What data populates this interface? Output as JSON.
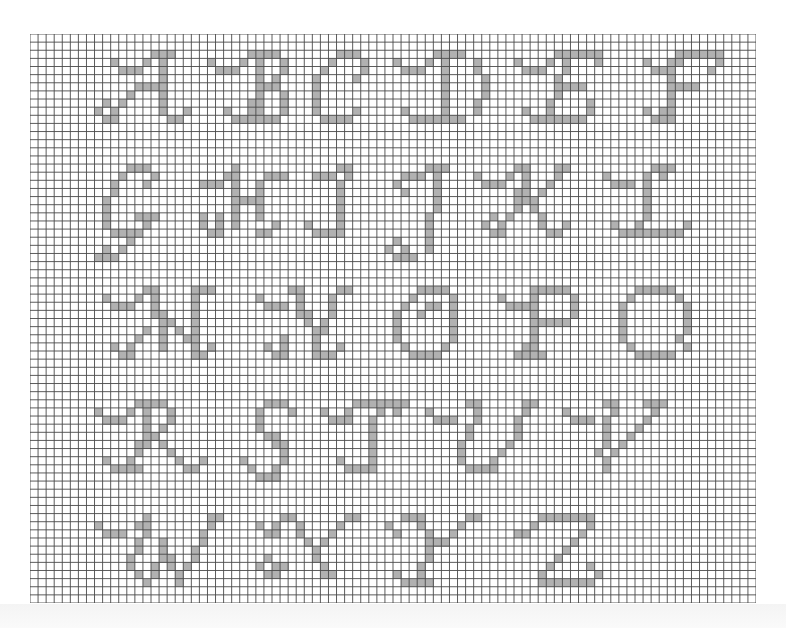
{
  "chart": {
    "cols": 90,
    "rows": 70,
    "origin_x": 30,
    "origin_y": 34,
    "width": 726,
    "height": 569,
    "grid_color": "#4a4a4a",
    "fill_color": "#b1b1b1",
    "background": "#ffffff"
  },
  "letters": [
    {
      "char": "A",
      "cells": {
        "2": [
          15,
          16,
          17
        ],
        "3": [
          10,
          14,
          16
        ],
        "4": [
          11,
          12,
          13,
          16
        ],
        "5": [
          16
        ],
        "6": [
          13,
          14,
          15,
          16
        ],
        "7": [
          12,
          16
        ],
        "8": [
          9,
          11,
          16
        ],
        "9": [
          8,
          10,
          16,
          19
        ],
        "10": [
          9,
          10,
          17,
          18
        ]
      }
    },
    {
      "char": "B",
      "cells": {
        "2": [
          27,
          28,
          29,
          30
        ],
        "3": [
          22,
          26,
          28,
          31
        ],
        "4": [
          23,
          24,
          25,
          28,
          31
        ],
        "5": [
          28,
          30
        ],
        "6": [
          28,
          29,
          30
        ],
        "7": [
          28,
          31
        ],
        "8": [
          27,
          28,
          31
        ],
        "9": [
          24,
          27,
          28,
          31
        ],
        "10": [
          25,
          26,
          27,
          28,
          29,
          30
        ]
      }
    },
    {
      "char": "C",
      "cells": {
        "2": [
          38,
          39,
          40
        ],
        "3": [
          37,
          41
        ],
        "4": [
          36,
          41
        ],
        "5": [
          35,
          40
        ],
        "6": [
          35
        ],
        "7": [
          35
        ],
        "8": [
          35
        ],
        "9": [
          35,
          40
        ],
        "10": [
          36,
          37,
          38,
          39
        ]
      }
    },
    {
      "char": "D",
      "cells": {
        "2": [
          50,
          51,
          52,
          53
        ],
        "3": [
          45,
          49,
          51,
          55
        ],
        "4": [
          46,
          47,
          48,
          51,
          55
        ],
        "5": [
          51,
          56
        ],
        "6": [
          51,
          56
        ],
        "7": [
          51,
          56
        ],
        "8": [
          51,
          55
        ],
        "9": [
          46,
          51,
          55
        ],
        "10": [
          47,
          48,
          49,
          50,
          51,
          52,
          53
        ]
      }
    },
    {
      "char": "E",
      "cells": {
        "2": [
          65,
          66,
          67,
          68,
          69,
          70
        ],
        "3": [
          60,
          64,
          66,
          70
        ],
        "4": [
          61,
          62,
          63,
          66
        ],
        "5": [
          65
        ],
        "6": [
          65,
          66,
          67,
          68
        ],
        "7": [
          65
        ],
        "8": [
          64,
          69
        ],
        "9": [
          61,
          64,
          69
        ],
        "10": [
          62,
          63,
          64,
          65,
          66,
          67,
          68
        ]
      }
    },
    {
      "char": "F",
      "cells": {
        "2": [
          80,
          81,
          82,
          83,
          84,
          85
        ],
        "3": [
          76,
          79,
          80,
          85
        ],
        "4": [
          77,
          78,
          79,
          84
        ],
        "5": [
          79
        ],
        "6": [
          79,
          80,
          81,
          82
        ],
        "7": [
          79
        ],
        "8": [
          79
        ],
        "9": [
          76,
          78,
          79
        ],
        "10": [
          77,
          78,
          79
        ]
      }
    },
    {
      "char": "G",
      "cells": {
        "16": [
          12,
          13,
          14
        ],
        "17": [
          11,
          15
        ],
        "18": [
          10,
          14
        ],
        "19": [
          10
        ],
        "20": [
          9
        ],
        "21": [
          9
        ],
        "22": [
          9,
          13,
          14,
          15
        ],
        "23": [
          9,
          14
        ],
        "24": [
          10,
          11,
          12,
          13
        ],
        "25": [
          12
        ],
        "26": [
          9,
          11
        ],
        "27": [
          8,
          9,
          10
        ]
      }
    },
    {
      "char": "H",
      "cells": {
        "16": [
          25
        ],
        "17": [
          24,
          25,
          29,
          30,
          31
        ],
        "18": [
          21,
          22,
          23,
          25,
          28
        ],
        "19": [
          25,
          28
        ],
        "20": [
          25,
          26,
          27,
          28
        ],
        "21": [
          25,
          28
        ],
        "22": [
          21,
          23,
          25,
          28
        ],
        "23": [
          21,
          23,
          25,
          30
        ],
        "24": [
          22,
          23,
          28,
          29
        ]
      }
    },
    {
      "char": "I",
      "cells": {
        "16": [
          38,
          39
        ],
        "17": [
          35,
          36,
          37,
          39
        ],
        "18": [
          38
        ],
        "19": [
          38
        ],
        "20": [
          38
        ],
        "21": [
          38
        ],
        "22": [
          38
        ],
        "23": [
          34,
          38
        ],
        "24": [
          35,
          36,
          37,
          38
        ]
      }
    },
    {
      "char": "J",
      "cells": {
        "16": [
          49,
          50,
          51
        ],
        "17": [
          46,
          47,
          48,
          50
        ],
        "18": [
          45,
          50
        ],
        "19": [
          46,
          50
        ],
        "20": [
          50
        ],
        "21": [
          50
        ],
        "22": [
          49
        ],
        "23": [
          49
        ],
        "24": [
          49
        ],
        "25": [
          45,
          49
        ],
        "26": [
          44,
          46,
          49
        ],
        "27": [
          45,
          46,
          47
        ]
      }
    },
    {
      "char": "K",
      "cells": {
        "16": [
          60,
          61,
          65,
          66
        ],
        "17": [
          55,
          59,
          61,
          65
        ],
        "18": [
          56,
          57,
          58,
          61,
          64
        ],
        "19": [
          60,
          61,
          63
        ],
        "20": [
          60,
          61,
          62
        ],
        "21": [
          60,
          62
        ],
        "22": [
          57,
          59,
          63
        ],
        "23": [
          56,
          58,
          63,
          66
        ],
        "24": [
          57,
          58,
          64,
          65
        ]
      }
    },
    {
      "char": "L",
      "cells": {
        "16": [
          77,
          78,
          79
        ],
        "17": [
          71,
          76,
          78
        ],
        "18": [
          72,
          73,
          74,
          76
        ],
        "19": [
          76
        ],
        "20": [
          76
        ],
        "21": [
          76
        ],
        "22": [
          76
        ],
        "23": [
          72,
          75,
          81
        ],
        "24": [
          73,
          74,
          75,
          76,
          77,
          78,
          79,
          80
        ]
      }
    },
    {
      "char": "M",
      "cells": {
        "31": [
          14,
          15,
          20,
          21,
          22
        ],
        "32": [
          9,
          13,
          15,
          20
        ],
        "33": [
          10,
          11,
          12,
          15,
          20
        ],
        "34": [
          15,
          16,
          20
        ],
        "35": [
          16,
          17,
          20
        ],
        "36": [
          14,
          16,
          18,
          20
        ],
        "37": [
          13,
          16,
          19,
          20
        ],
        "38": [
          10,
          12,
          16,
          20,
          22
        ],
        "39": [
          11,
          12,
          20,
          21
        ]
      }
    },
    {
      "char": "N",
      "cells": {
        "31": [
          32,
          33,
          38,
          39
        ],
        "32": [
          28,
          33,
          37
        ],
        "33": [
          29,
          30,
          31,
          33,
          37
        ],
        "34": [
          33,
          34,
          37
        ],
        "35": [
          34,
          36
        ],
        "36": [
          35,
          36
        ],
        "37": [
          31,
          35
        ],
        "38": [
          29,
          31,
          35,
          38
        ],
        "39": [
          30,
          31,
          35,
          36,
          37
        ]
      }
    },
    {
      "char": "O",
      "cells": {
        "31": [
          48,
          49,
          50,
          51
        ],
        "32": [
          47,
          52
        ],
        "33": [
          46,
          49,
          50,
          52
        ],
        "34": [
          45,
          48,
          52
        ],
        "35": [
          45,
          52
        ],
        "36": [
          45,
          52
        ],
        "37": [
          45,
          52
        ],
        "38": [
          46,
          51
        ],
        "39": [
          47,
          48,
          49,
          50
        ]
      }
    },
    {
      "char": "P",
      "cells": {
        "31": [
          62,
          63,
          64,
          65,
          66
        ],
        "32": [
          58,
          62,
          67
        ],
        "33": [
          59,
          60,
          61,
          62,
          67
        ],
        "34": [
          62,
          67
        ],
        "35": [
          62,
          63,
          64,
          65,
          66
        ],
        "36": [
          62
        ],
        "37": [
          62
        ],
        "38": [
          61,
          62
        ],
        "39": [
          60,
          61,
          62,
          63
        ]
      }
    },
    {
      "char": "Q",
      "cells": {
        "31": [
          75,
          76,
          77,
          78,
          79
        ],
        "32": [
          74,
          80
        ],
        "33": [
          73,
          81
        ],
        "34": [
          73,
          81
        ],
        "35": [
          73,
          81
        ],
        "36": [
          73,
          81
        ],
        "37": [
          73,
          80
        ],
        "38": [
          74,
          81
        ],
        "39": [
          75,
          76,
          77,
          78,
          79
        ]
      }
    },
    {
      "char": "R",
      "cells": {
        "45": [
          13,
          14,
          15,
          16
        ],
        "46": [
          8,
          12,
          14,
          17
        ],
        "47": [
          9,
          10,
          11,
          14,
          17
        ],
        "48": [
          14,
          16
        ],
        "49": [
          14,
          15
        ],
        "50": [
          13,
          14,
          16
        ],
        "51": [
          13,
          17
        ],
        "52": [
          9,
          12,
          18,
          21
        ],
        "53": [
          10,
          11,
          12,
          13,
          19,
          20
        ]
      }
    },
    {
      "char": "S",
      "cells": {
        "45": [
          29,
          30,
          31
        ],
        "46": [
          28,
          32
        ],
        "47": [
          28
        ],
        "48": [
          28
        ],
        "49": [
          29,
          30
        ],
        "50": [
          30,
          31
        ],
        "51": [
          31
        ],
        "52": [
          26,
          31
        ],
        "53": [
          27,
          30
        ],
        "54": [
          28,
          29,
          30
        ]
      }
    },
    {
      "char": "T",
      "cells": {
        "45": [
          40,
          41,
          42,
          43,
          44
        ],
        "46": [
          36,
          39,
          43
        ],
        "47": [
          37,
          38,
          39,
          42
        ],
        "48": [
          42
        ],
        "49": [
          42
        ],
        "50": [
          42
        ],
        "51": [
          42
        ],
        "52": [
          38,
          42
        ],
        "53": [
          39,
          40,
          41,
          42
        ]
      }
    },
    {
      "char": "U",
      "cells": {
        "45": [
          45,
          46,
          54,
          55,
          61,
          62
        ],
        "46": [
          45,
          49,
          55,
          61
        ],
        "47": [
          50,
          51,
          52,
          55,
          60
        ],
        "48": [
          54,
          60
        ],
        "49": [
          54,
          60
        ],
        "50": [
          53,
          59
        ],
        "51": [
          53,
          58
        ],
        "52": [
          53,
          57
        ],
        "53": [
          54,
          55,
          56,
          57
        ]
      }
    },
    {
      "char": "V",
      "cells": {
        "45": [
          71,
          72,
          76,
          77,
          78
        ],
        "46": [
          66,
          72,
          77
        ],
        "47": [
          67,
          68,
          69,
          71,
          76
        ],
        "48": [
          71,
          75
        ],
        "49": [
          71,
          74
        ],
        "50": [
          71,
          73
        ],
        "51": [
          70,
          72
        ],
        "52": [
          71
        ],
        "53": [
          71
        ]
      }
    },
    {
      "char": "W",
      "cells": {
        "59": [
          14,
          22,
          23
        ],
        "60": [
          8,
          13,
          14,
          22
        ],
        "61": [
          9,
          10,
          11,
          14,
          21
        ],
        "62": [
          13,
          16,
          21
        ],
        "63": [
          13,
          16,
          20
        ],
        "64": [
          12,
          16,
          17,
          20
        ],
        "65": [
          12,
          15,
          17,
          19
        ],
        "66": [
          13,
          15,
          18
        ],
        "67": [
          14,
          18
        ]
      }
    },
    {
      "char": "X",
      "cells": {
        "59": [
          31,
          32,
          39,
          40
        ],
        "60": [
          28,
          30,
          33,
          38
        ],
        "61": [
          29,
          30,
          33,
          37
        ],
        "62": [
          34,
          36
        ],
        "63": [
          35
        ],
        "64": [
          29,
          35
        ],
        "65": [
          28,
          30,
          31,
          36
        ],
        "66": [
          29,
          30,
          36,
          37
        ]
      }
    },
    {
      "char": "Y",
      "cells": {
        "59": [
          46,
          47,
          48,
          54,
          55
        ],
        "60": [
          44,
          48,
          53
        ],
        "61": [
          45,
          49,
          52
        ],
        "62": [
          49,
          50,
          51
        ],
        "63": [
          49
        ],
        "64": [
          49
        ],
        "65": [
          48
        ],
        "66": [
          45,
          48
        ],
        "67": [
          46,
          47,
          48,
          49
        ]
      }
    },
    {
      "char": "Z",
      "cells": {
        "59": [
          63,
          64,
          65,
          66,
          67,
          68,
          69
        ],
        "60": [
          62,
          69
        ],
        "61": [
          60,
          61,
          68
        ],
        "62": [
          67
        ],
        "63": [
          66
        ],
        "64": [
          65
        ],
        "65": [
          64,
          69
        ],
        "66": [
          63,
          70
        ],
        "67": [
          63,
          64,
          65,
          66,
          67,
          68,
          69
        ]
      }
    }
  ]
}
